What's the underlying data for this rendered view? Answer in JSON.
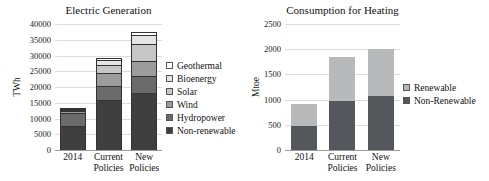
{
  "figure": {
    "background": "#ffffff"
  },
  "chart_data": [
    {
      "type": "bar",
      "stacked": true,
      "title": "Electric Generation",
      "ylabel": "TWh",
      "ylim": [
        0,
        40000
      ],
      "yticks": [
        0,
        5000,
        10000,
        15000,
        20000,
        25000,
        30000,
        35000,
        40000
      ],
      "grid": true,
      "legend_position": "right",
      "segment_outline": "#333333",
      "categories": [
        "2014",
        "Current Policies",
        "New Policies"
      ],
      "series": [
        {
          "name": "Non-renewable",
          "color": "#3f3f3f",
          "values": [
            7700,
            15800,
            18200
          ]
        },
        {
          "name": "Hydropower",
          "color": "#6b6b6b",
          "values": [
            4100,
            4500,
            5500
          ]
        },
        {
          "name": "Wind",
          "color": "#9c9c9c",
          "values": [
            600,
            4000,
            4700
          ]
        },
        {
          "name": "Solar",
          "color": "#c7c7c7",
          "values": [
            150,
            2600,
            5300
          ]
        },
        {
          "name": "Bioenergy",
          "color": "#e5e5e5",
          "values": [
            350,
            1450,
            2800
          ]
        },
        {
          "name": "Geothermal",
          "color": "#ffffff",
          "values": [
            100,
            650,
            1000
          ]
        }
      ]
    },
    {
      "type": "bar",
      "stacked": true,
      "title": "Consumption for Heating",
      "ylabel": "Mtoe",
      "ylim": [
        0,
        2500
      ],
      "yticks": [
        0,
        500,
        1000,
        1500,
        2000,
        2500
      ],
      "grid": true,
      "legend_position": "right",
      "categories": [
        "2014",
        "Current Policies",
        "New Policies"
      ],
      "series": [
        {
          "name": "Non-Renewable",
          "color": "#54585c",
          "values": [
            470,
            975,
            1075
          ]
        },
        {
          "name": "Renewable",
          "color": "#b7b9bb",
          "values": [
            430,
            875,
            925
          ]
        }
      ]
    }
  ]
}
